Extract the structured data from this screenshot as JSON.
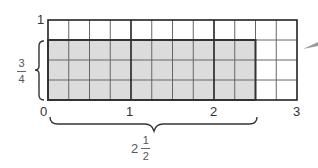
{
  "diagram": {
    "type": "area-model-grid",
    "grid": {
      "columns": 12,
      "rows": 4,
      "columns_per_unit": 4,
      "rows_per_unit": 4
    },
    "shaded": {
      "columns": 10,
      "rows": 3,
      "color": "#dcdcdc"
    },
    "colors": {
      "grid_line": "#555555",
      "unit_line": "#222222",
      "shade": "#dcdcdc",
      "outline": "#333333"
    },
    "y_axis": {
      "top_label": "1"
    },
    "x_axis": {
      "tick_labels": [
        "0",
        "1",
        "2",
        "3"
      ]
    },
    "height_brace": {
      "numerator": "3",
      "denominator": "4"
    },
    "width_brace": {
      "whole": "2",
      "numerator": "1",
      "denominator": "2"
    }
  }
}
